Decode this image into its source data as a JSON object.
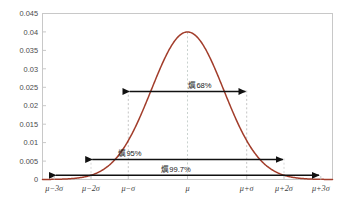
{
  "figure": {
    "background_color": "#ffffff",
    "frame_color": "#c8c8c8"
  },
  "chart_data": {
    "type": "line",
    "title": "",
    "subtitle": "",
    "xlabel": "",
    "ylabel": "",
    "curve_name": "normal-distribution-density",
    "curve_color": "#a23d2b",
    "distribution": {
      "mean_label": "μ",
      "sigma_label": "σ",
      "peak_density": 0.04,
      "sigma_value": 10
    },
    "xlim": [
      -4,
      4
    ],
    "ylim": [
      0,
      0.045
    ],
    "grid": false,
    "legend": null,
    "x_tick_labels": [
      "μ−3σ",
      "μ−2σ",
      "μ−σ",
      "μ",
      "μ+σ",
      "μ+2σ",
      "μ+3σ"
    ],
    "x_tick_values": [
      -3,
      -2,
      -1,
      0,
      1,
      2,
      3
    ],
    "y_tick_labels": [
      "0",
      "0.005",
      "0.01",
      "0.015",
      "0.02",
      "0.025",
      "0.03",
      "0.035",
      "0.04",
      "0.045"
    ],
    "y_tick_values": [
      0,
      0.005,
      0.01,
      0.015,
      0.02,
      0.025,
      0.03,
      0.035,
      0.04,
      0.045
    ],
    "x": [
      -4,
      -3.75,
      -3.5,
      -3.25,
      -3,
      -2.75,
      -2.5,
      -2.25,
      -2,
      -1.75,
      -1.5,
      -1.25,
      -1,
      -0.75,
      -0.5,
      -0.25,
      0,
      0.25,
      0.5,
      0.75,
      1,
      1.25,
      1.5,
      1.75,
      2,
      2.25,
      2.5,
      2.75,
      3,
      3.25,
      3.5,
      3.75,
      4
    ],
    "y": [
      0.00013,
      0.00035,
      0.00087,
      0.00203,
      0.00443,
      0.00909,
      0.01753,
      0.03174,
      0.05399,
      0.08628,
      0.12952,
      0.18265,
      0.24197,
      0.30114,
      0.35207,
      0.38667,
      0.39894,
      0.38667,
      0.35207,
      0.30114,
      0.24197,
      0.18265,
      0.12952,
      0.08628,
      0.05399,
      0.03174,
      0.01753,
      0.00909,
      0.00443,
      0.00203,
      0.00087,
      0.00035,
      0.00013
    ],
    "annotations": [
      {
        "name": "sigma-1-range",
        "label": "爄68%",
        "percent": 68,
        "from_x": -1,
        "to_x": 1,
        "at_y": 0.0239
      },
      {
        "name": "sigma-2-range",
        "label": "爄95%",
        "percent": 95,
        "from_x": -2,
        "to_x": 2,
        "at_y": 0.0043
      },
      {
        "name": "sigma-3-range",
        "label": "爄99.7%",
        "percent": 99.7,
        "from_x": -3,
        "to_x": 3,
        "at_y": 0.0009
      }
    ],
    "dashed_guides": [
      {
        "name": "guide-minus-2-sigma",
        "x": -2,
        "top_y": 0.0057,
        "color": "#cccccc"
      },
      {
        "name": "guide-minus-1-sigma",
        "x": -1,
        "top_y": 0.0242,
        "color": "#bdbdbd"
      },
      {
        "name": "guide-mean",
        "x": 0,
        "top_y": 0.0399,
        "color": "#c4ccc8"
      },
      {
        "name": "guide-plus-1-sigma",
        "x": 1,
        "top_y": 0.0242,
        "color": "#bdbdbd"
      },
      {
        "name": "guide-plus-2-sigma",
        "x": 2,
        "top_y": 0.0057,
        "color": "#cccccc"
      }
    ]
  }
}
